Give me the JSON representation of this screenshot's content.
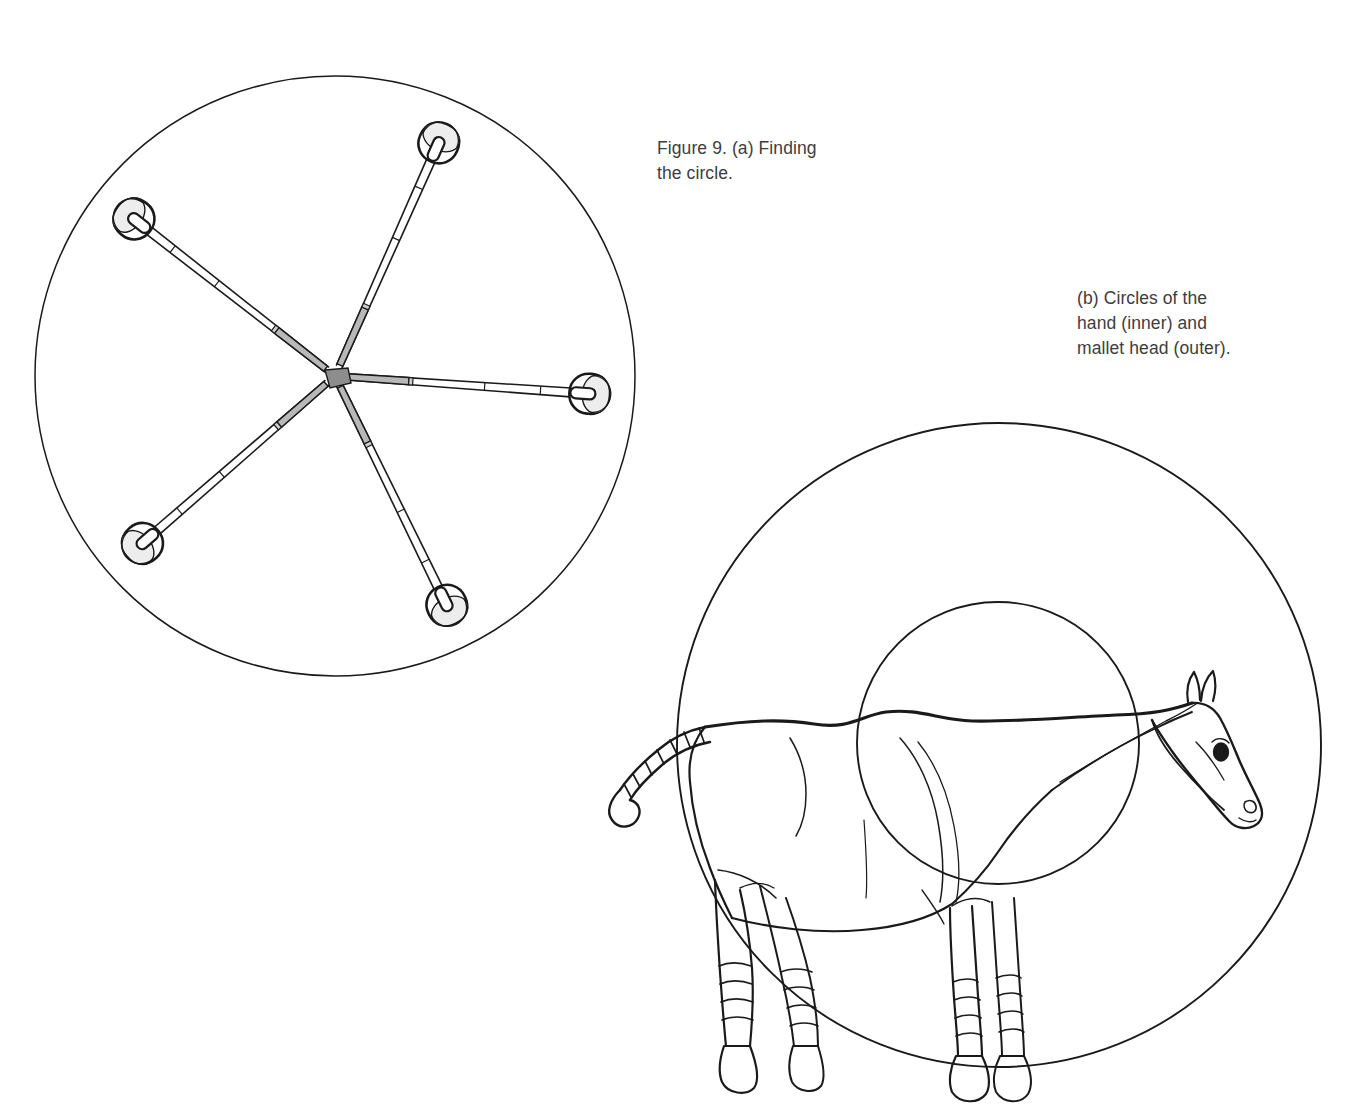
{
  "figure": {
    "number": "Figure 9.",
    "caption_a": "Figure 9. (a) Finding\nthe circle.",
    "caption_b": "(b) Circles of the\nhand (inner) and\nmallet head (outer)."
  },
  "panel_a": {
    "name": "finding-the-circle",
    "description": "Five croquet mallets arranged radially, handles meeting at a common centre, their heads touching a traced circle.",
    "circle": {
      "cx": 335,
      "cy": 376,
      "r": 300
    },
    "mallet_count": 5,
    "mallets": [
      {
        "index": 1,
        "angle_deg": -66,
        "label": "mallet-top"
      },
      {
        "index": 2,
        "angle_deg": -142,
        "label": "mallet-upper-left"
      },
      {
        "index": 3,
        "angle_deg": 139,
        "label": "mallet-lower-left"
      },
      {
        "index": 4,
        "angle_deg": 64,
        "label": "mallet-lower-right"
      },
      {
        "index": 5,
        "angle_deg": 4,
        "label": "mallet-right"
      }
    ],
    "grip_color": "#b8b8b8",
    "head_color": "#e9e9e9"
  },
  "panel_b": {
    "name": "circles-of-hand-and-mallet-head",
    "description": "Line drawing of a standing horse overlaid with two concentric circles: the small inner circle is the circle of the hand, the large outer circle is the circle of the mallet head.",
    "outer_circle": {
      "cx": 999,
      "cy": 745,
      "r": 322,
      "label": "mallet head (outer)"
    },
    "inner_circle": {
      "cx": 998,
      "cy": 743,
      "r": 141,
      "label": "hand (inner)"
    },
    "subject": "horse",
    "horse_features": [
      "banded tail",
      "mane line",
      "ears",
      "eye",
      "nostril",
      "bandaged legs",
      "hooves"
    ]
  },
  "colors": {
    "ink": "#1a1a1a",
    "text": "#3d3d3d",
    "background": "#ffffff",
    "grip_gray": "#b8b8b8",
    "head_gray": "#e9e9e9"
  }
}
